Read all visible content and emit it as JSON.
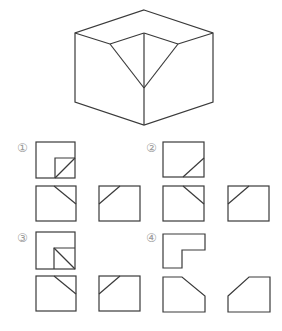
{
  "figure": {
    "cube": {
      "outline": [
        [
          144,
          10
        ],
        [
          213,
          33
        ],
        [
          213,
          102
        ],
        [
          144,
          125
        ],
        [
          75,
          102
        ],
        [
          75,
          33
        ]
      ],
      "inner_triangle": [
        [
          110,
          44
        ],
        [
          144,
          33
        ],
        [
          178,
          44
        ],
        [
          144,
          88
        ]
      ],
      "edges": [
        [
          [
            75,
            33
          ],
          [
            110,
            44
          ]
        ],
        [
          [
            178,
            44
          ],
          [
            213,
            33
          ]
        ],
        [
          [
            144,
            33
          ],
          [
            144,
            125
          ]
        ],
        [
          [
            110,
            44
          ],
          [
            144,
            88
          ]
        ],
        [
          [
            178,
            44
          ],
          [
            144,
            88
          ]
        ],
        [
          [
            110,
            44
          ],
          [
            144,
            33
          ]
        ],
        [
          [
            144,
            33
          ],
          [
            178,
            44
          ]
        ]
      ]
    },
    "options": [
      {
        "label": "①",
        "label_pos": [
          17,
          152
        ],
        "top": {
          "rect": [
            36,
            142,
            39,
            36
          ],
          "lines": [
            [
              [
                55,
                158
              ],
              [
                75,
                158
              ]
            ],
            [
              [
                55,
                158
              ],
              [
                55,
                178
              ]
            ],
            [
              [
                55,
                178
              ],
              [
                75,
                158
              ]
            ]
          ]
        },
        "front": {
          "rect": [
            36,
            186,
            40,
            35
          ],
          "lines": [
            [
              [
                54,
                186
              ],
              [
                76,
                204
              ]
            ]
          ]
        },
        "side": {
          "rect": [
            99,
            186,
            41,
            35
          ],
          "lines": [
            [
              [
                99,
                204
              ],
              [
                120,
                186
              ]
            ]
          ]
        }
      },
      {
        "label": "②",
        "label_pos": [
          146,
          152
        ],
        "top": {
          "rect": [
            163,
            142,
            41,
            35
          ],
          "lines": [
            [
              [
                183,
                177
              ],
              [
                204,
                158
              ]
            ]
          ]
        },
        "front": {
          "rect": [
            163,
            186,
            41,
            35
          ],
          "lines": [
            [
              [
                183,
                186
              ],
              [
                204,
                204
              ]
            ]
          ]
        },
        "side": {
          "rect": [
            228,
            186,
            41,
            35
          ],
          "lines": [
            [
              [
                228,
                204
              ],
              [
                249,
                186
              ]
            ]
          ]
        }
      },
      {
        "label": "③",
        "label_pos": [
          17,
          242
        ],
        "top": {
          "rect": [
            36,
            232,
            39,
            37
          ],
          "lines": [
            [
              [
                54,
                248
              ],
              [
                75,
                248
              ]
            ],
            [
              [
                54,
                248
              ],
              [
                54,
                269
              ]
            ],
            [
              [
                54,
                248
              ],
              [
                75,
                269
              ]
            ]
          ]
        },
        "front": {
          "rect": [
            36,
            276,
            40,
            35
          ],
          "lines": [
            [
              [
                54,
                276
              ],
              [
                76,
                294
              ]
            ]
          ]
        },
        "side": {
          "rect": [
            99,
            276,
            41,
            35
          ],
          "lines": [
            [
              [
                99,
                294
              ],
              [
                120,
                276
              ]
            ]
          ]
        }
      },
      {
        "label": "④",
        "label_pos": [
          146,
          242
        ],
        "top": {
          "polygon": [
            [
              163,
              234
            ],
            [
              205,
              234
            ],
            [
              205,
              250
            ],
            [
              182,
              250
            ],
            [
              182,
              268
            ],
            [
              163,
              268
            ]
          ]
        },
        "front": {
          "polygon": [
            [
              163,
              277
            ],
            [
              182,
              277
            ],
            [
              205,
              296
            ],
            [
              205,
              312
            ],
            [
              163,
              312
            ]
          ]
        },
        "side": {
          "polygon": [
            [
              228,
              296
            ],
            [
              249,
              277
            ],
            [
              270,
              277
            ],
            [
              270,
              312
            ],
            [
              228,
              312
            ]
          ]
        }
      }
    ]
  },
  "labels": {
    "opt1": "①",
    "opt2": "②",
    "opt3": "③",
    "opt4": "④"
  }
}
